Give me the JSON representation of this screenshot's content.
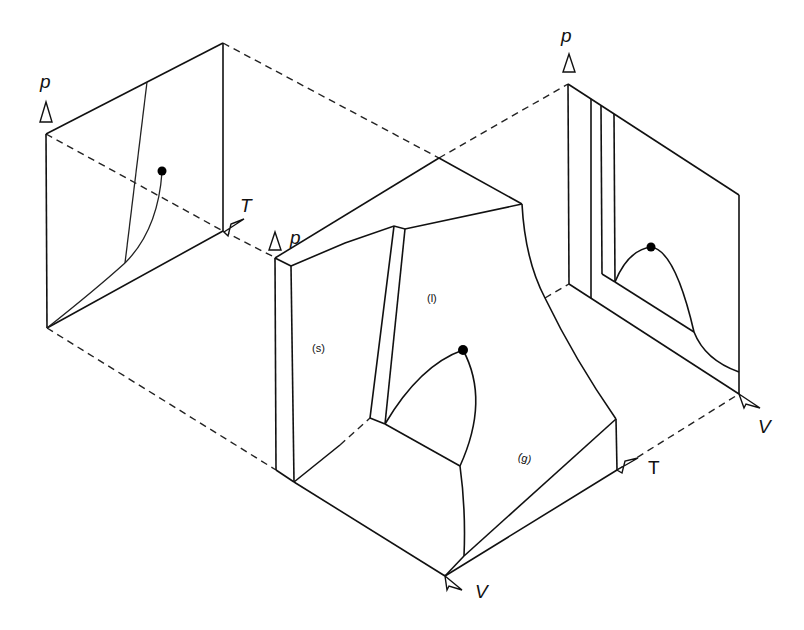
{
  "diagram": {
    "background": "#ffffff",
    "line_color": "#111111",
    "panels": {
      "pT_projection": {
        "axes": {
          "vertical": "p",
          "horizontal": "T"
        },
        "features": [
          "fusion line",
          "vaporization curve",
          "critical point",
          "sublimation curve"
        ]
      },
      "pVT_surface": {
        "axes": {
          "vertical": "p",
          "depth": "T",
          "horizontal": "V"
        },
        "regions": {
          "solid": "(s)",
          "liquid": "(l)",
          "gas": "(g)"
        },
        "features": [
          "critical point",
          "coexistence dome",
          "triple line"
        ]
      },
      "pV_projection": {
        "axes": {
          "vertical": "p",
          "horizontal": "V"
        },
        "features": [
          "solid region boundaries",
          "liquid-vapor dome",
          "critical point"
        ]
      }
    },
    "labels": {
      "left_p": "p",
      "left_T": "T",
      "main_p": "p",
      "main_T": "T",
      "main_V": "V",
      "right_p": "p",
      "right_V": "V",
      "solid": "(s)",
      "liquid": "(l)",
      "gas": "(g)"
    }
  }
}
